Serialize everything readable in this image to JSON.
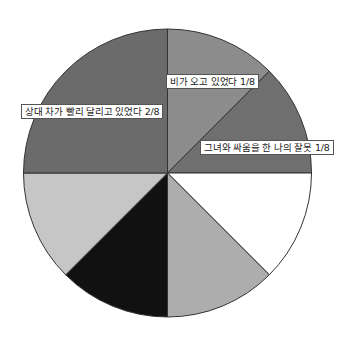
{
  "chart_data": {
    "type": "pie",
    "title": "",
    "start_angle_deg": 0,
    "direction": "clockwise",
    "total_parts": 8,
    "slices": [
      {
        "label": "비가 오고 있었다 1/8",
        "value": 1,
        "fraction": "1/8",
        "color": "#8c8c8c",
        "labeled": true
      },
      {
        "label": "그녀와 싸움을 한 나의 잘못 1/8",
        "value": 1,
        "fraction": "1/8",
        "color": "#6f6f6f",
        "labeled": true
      },
      {
        "label": "",
        "value": 1,
        "fraction": "1/8",
        "color": "#ffffff",
        "labeled": false
      },
      {
        "label": "",
        "value": 1,
        "fraction": "1/8",
        "color": "#adadad",
        "labeled": false
      },
      {
        "label": "",
        "value": 1,
        "fraction": "1/8",
        "color": "#111111",
        "labeled": false
      },
      {
        "label": "",
        "value": 1,
        "fraction": "1/8",
        "color": "#c6c6c6",
        "labeled": false
      },
      {
        "label": "상대 차가 빨리 달리고 있었다 2/8",
        "value": 2,
        "fraction": "2/8",
        "color": "#6b6b6b",
        "labeled": true
      }
    ],
    "legend": "none"
  },
  "labels": {
    "rain": "비가 오고 있었다 1/8",
    "my_fault": "그녀와 싸움을 한 나의 잘못 1/8",
    "other_car": "상대 차가 빨리 달리고 있었다 2/8"
  },
  "geometry": {
    "cx": 167.5,
    "cy": 173,
    "r": 144,
    "stroke": "#333333"
  }
}
